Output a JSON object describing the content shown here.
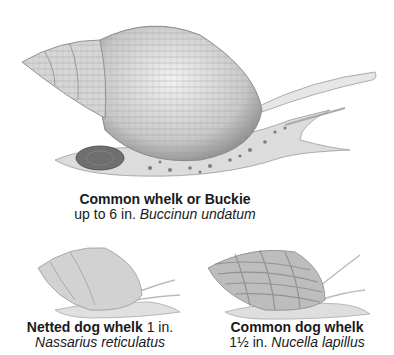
{
  "species": [
    {
      "id": "common-whelk",
      "name": "Common whelk or Buckie",
      "size": "up to 6 in.",
      "latin": "Buccinun undatum"
    },
    {
      "id": "netted-dog-whelk",
      "name": "Netted dog whelk",
      "size": "1 in.",
      "latin": "Nassarius reticulatus"
    },
    {
      "id": "common-dog-whelk",
      "name": "Common dog whelk",
      "size": "1½ in.",
      "latin": "Nucella lapillus"
    }
  ],
  "colors": {
    "background": "#ffffff",
    "ink": "#1a1a1a",
    "shell_light": "#e4e4e4",
    "shell_mid": "#b9b9b9",
    "shell_dark": "#6f6f6f"
  }
}
